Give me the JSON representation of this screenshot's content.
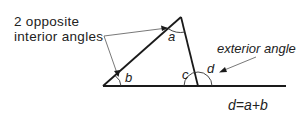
{
  "diagram": {
    "labels": {
      "opposite_line1": "2 opposite",
      "opposite_line2": "interior angles",
      "exterior": "exterior angle",
      "formula": "d=a+b"
    },
    "angles": {
      "a": "a",
      "b": "b",
      "c": "c",
      "d": "d"
    },
    "colors": {
      "stroke": "#1a1a1a",
      "text": "#222222",
      "background": "#ffffff"
    }
  }
}
